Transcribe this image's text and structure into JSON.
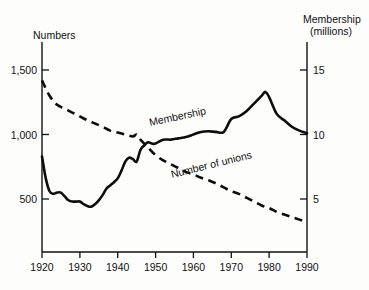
{
  "chart_data": {
    "type": "line",
    "title": "",
    "xlabel": "",
    "ylabel": "Numbers",
    "ylabel_right_line1": "Membership",
    "ylabel_right_line2": "(millions)",
    "xlim": [
      1920,
      1990
    ],
    "ylim_left": [
      0,
      1750
    ],
    "ylim_right": [
      0,
      17.5
    ],
    "grid": false,
    "legend": "inline-annotations",
    "xticks": [
      1920,
      1930,
      1940,
      1950,
      1960,
      1970,
      1980,
      1990
    ],
    "xtick_labels": [
      "1920",
      "1930",
      "1940",
      "1950",
      "1960",
      "1970",
      "1980",
      "1990"
    ],
    "yticks_left": [
      500,
      1000,
      1500
    ],
    "ytick_labels_left": [
      "500",
      "1,000",
      "1,500"
    ],
    "yticks_right": [
      5,
      10,
      15
    ],
    "ytick_labels_right": [
      "5",
      "10",
      "15"
    ],
    "annotations": [
      {
        "text": "Membership",
        "x": 1953,
        "y_right": 11.0,
        "rotation": -12
      },
      {
        "text": "Number of unions",
        "x": 1962,
        "y_left": 700,
        "rotation": -14
      }
    ],
    "series": [
      {
        "name": "Membership",
        "axis": "right",
        "unit": "millions",
        "style": "solid",
        "x": [
          1920,
          1921,
          1922,
          1923,
          1924,
          1925,
          1926,
          1927,
          1928,
          1929,
          1930,
          1931,
          1932,
          1933,
          1934,
          1935,
          1936,
          1937,
          1938,
          1939,
          1940,
          1941,
          1942,
          1943,
          1944,
          1945,
          1946,
          1947,
          1948,
          1949,
          1950,
          1952,
          1954,
          1956,
          1958,
          1960,
          1962,
          1964,
          1966,
          1968,
          1970,
          1972,
          1974,
          1976,
          1978,
          1979,
          1980,
          1982,
          1984,
          1986,
          1988,
          1990
        ],
        "y": [
          8.3,
          6.6,
          5.6,
          5.4,
          5.5,
          5.5,
          5.2,
          4.9,
          4.8,
          4.8,
          4.8,
          4.6,
          4.45,
          4.4,
          4.6,
          4.9,
          5.3,
          5.8,
          6.05,
          6.3,
          6.6,
          7.2,
          7.9,
          8.2,
          8.1,
          7.9,
          8.8,
          9.15,
          9.4,
          9.3,
          9.3,
          9.6,
          9.6,
          9.7,
          9.8,
          10.0,
          10.2,
          10.25,
          10.2,
          10.2,
          11.2,
          11.4,
          11.8,
          12.4,
          13.0,
          13.3,
          12.9,
          11.6,
          11.1,
          10.6,
          10.3,
          10.1
        ],
        "start_value": 8.3,
        "min_value": 4.4,
        "min_year": 1933,
        "peak_value": 13.3,
        "peak_year": 1979,
        "end_value": 10.1
      },
      {
        "name": "Number of unions",
        "axis": "left",
        "unit": "count",
        "style": "dashed",
        "x": [
          1920,
          1922,
          1924,
          1926,
          1928,
          1930,
          1932,
          1934,
          1936,
          1938,
          1940,
          1942,
          1944,
          1945,
          1946,
          1948,
          1950,
          1952,
          1954,
          1956,
          1958,
          1960,
          1962,
          1964,
          1966,
          1968,
          1970,
          1972,
          1974,
          1976,
          1978,
          1980,
          1982,
          1984,
          1986,
          1988,
          1990
        ],
        "y": [
          1420,
          1300,
          1230,
          1200,
          1170,
          1140,
          1110,
          1085,
          1060,
          1030,
          1015,
          1000,
          985,
          1000,
          960,
          900,
          840,
          800,
          770,
          740,
          710,
          690,
          665,
          645,
          620,
          590,
          560,
          540,
          510,
          480,
          450,
          430,
          400,
          380,
          360,
          340,
          320
        ],
        "start_value": 1420,
        "end_value": 320
      }
    ],
    "crossover": {
      "year": 1946,
      "left_value": 960,
      "right_value": 8.8
    }
  }
}
